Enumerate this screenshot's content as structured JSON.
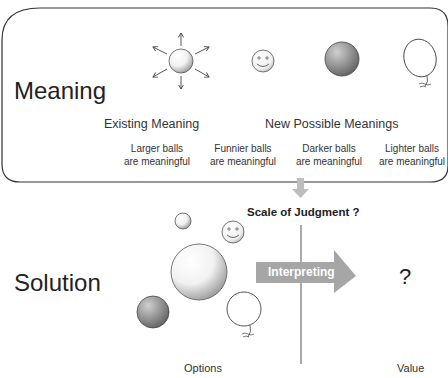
{
  "top_panel": {
    "row_label": "Meaning",
    "existing_heading": "Existing Meaning",
    "new_heading": "New Possible Meanings",
    "captions": [
      {
        "line1": "Larger balls",
        "line2": "are meaningful"
      },
      {
        "line1": "Funnier balls",
        "line2": "are meaningful"
      },
      {
        "line1": "Darker balls",
        "line2": "are meaningful"
      },
      {
        "line1": "Lighter balls",
        "line2": "are meaningful"
      }
    ],
    "icons": [
      "radiating-ball-icon",
      "smiley-ball-icon",
      "dark-ball-icon",
      "balloon-icon"
    ]
  },
  "bottom_panel": {
    "row_label": "Solution",
    "scale_label": "Scale of Judgment ?",
    "arrow_label": "Interpreting",
    "value_mark": "?",
    "options_label": "Options",
    "value_label": "Value"
  },
  "colors": {
    "outline": "#333333",
    "arrow_fill": "#a6a6a6",
    "down_arrow": "#bdbdbd",
    "divider": "#555555"
  }
}
